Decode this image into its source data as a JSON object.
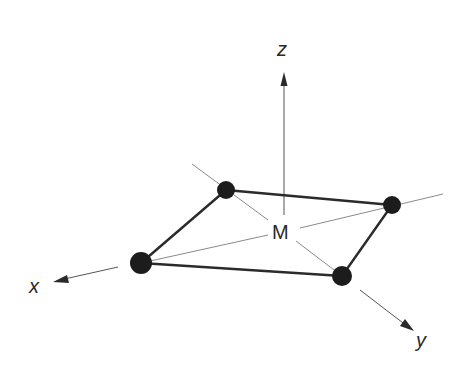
{
  "diagram": {
    "labels": {
      "z_axis": "z",
      "x_axis": "x",
      "y_axis": "y",
      "center": "M"
    },
    "center": {
      "label": "M",
      "x": 283,
      "y": 231
    },
    "atoms": [
      {
        "name": "back-left",
        "x": 226,
        "y": 190,
        "r": 9
      },
      {
        "name": "back-right",
        "x": 392,
        "y": 205,
        "r": 9
      },
      {
        "name": "front-left",
        "x": 141,
        "y": 263,
        "r": 11
      },
      {
        "name": "front-right",
        "x": 342,
        "y": 276,
        "r": 10
      }
    ],
    "colors": {
      "atom": "#1c1c1c",
      "bond": "#2b2b2b",
      "guide_line": "#8a8a8a",
      "axis": "#555555",
      "text": "#2a2a2a",
      "background": "#ffffff"
    }
  }
}
